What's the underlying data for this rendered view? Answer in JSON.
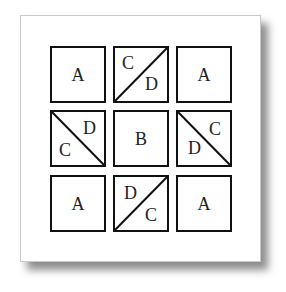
{
  "diagram": {
    "type": "tile-grid",
    "rows": 3,
    "cols": 3,
    "colors": {
      "border": "#111111",
      "text": "#222222",
      "card_background": "#ffffff",
      "card_border": "#c8c8c8"
    },
    "tiles": [
      {
        "row": 0,
        "col": 0,
        "kind": "single",
        "label": "A"
      },
      {
        "row": 0,
        "col": 1,
        "kind": "split",
        "diagonal": "bottom-left-to-top-right",
        "label_upper_left": "C",
        "label_lower_right": "D"
      },
      {
        "row": 0,
        "col": 2,
        "kind": "single",
        "label": "A"
      },
      {
        "row": 1,
        "col": 0,
        "kind": "split",
        "diagonal": "top-left-to-bottom-right",
        "label_upper_right": "D",
        "label_lower_left": "C"
      },
      {
        "row": 1,
        "col": 1,
        "kind": "single",
        "label": "B"
      },
      {
        "row": 1,
        "col": 2,
        "kind": "split",
        "diagonal": "top-left-to-bottom-right",
        "label_upper_right": "C",
        "label_lower_left": "D"
      },
      {
        "row": 2,
        "col": 0,
        "kind": "single",
        "label": "A"
      },
      {
        "row": 2,
        "col": 1,
        "kind": "split",
        "diagonal": "bottom-left-to-top-right",
        "label_upper_left": "D",
        "label_lower_right": "C"
      },
      {
        "row": 2,
        "col": 2,
        "kind": "single",
        "label": "A"
      }
    ]
  }
}
